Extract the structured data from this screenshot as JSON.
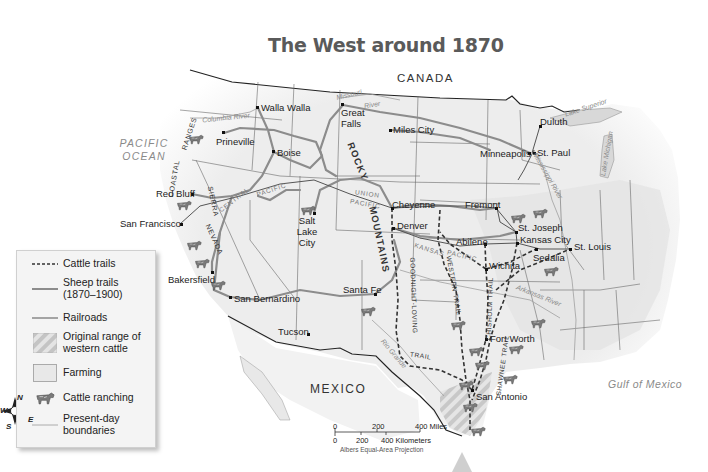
{
  "title": "The West around 1870",
  "regions": {
    "canada": "CANADA",
    "mexico": "MEXICO",
    "pacific_ocean_1": "PACIFIC",
    "pacific_ocean_2": "OCEAN",
    "gulf": "Gulf of Mexico"
  },
  "cities": [
    {
      "name": "Walla Walla",
      "x": 258,
      "y": 108
    },
    {
      "name": "Prineville",
      "x": 224,
      "y": 133
    },
    {
      "name": "Boise",
      "x": 274,
      "y": 152
    },
    {
      "name": "Great Falls",
      "x": 343,
      "y": 105
    },
    {
      "name": "Miles City",
      "x": 390,
      "y": 130
    },
    {
      "name": "Duluth",
      "x": 540,
      "y": 126
    },
    {
      "name": "Minneapolis",
      "x": 530,
      "y": 153
    },
    {
      "name": "St. Paul",
      "x": 532,
      "y": 153
    },
    {
      "name": "Red Bluff",
      "x": 192,
      "y": 194
    },
    {
      "name": "San Francisco",
      "x": 180,
      "y": 224
    },
    {
      "name": "Salt Lake City",
      "x": 314,
      "y": 213
    },
    {
      "name": "Cheyenne",
      "x": 392,
      "y": 208
    },
    {
      "name": "Denver",
      "x": 393,
      "y": 228
    },
    {
      "name": "Fremont",
      "x": 496,
      "y": 208
    },
    {
      "name": "St. Joseph",
      "x": 516,
      "y": 232
    },
    {
      "name": "Kansas City",
      "x": 517,
      "y": 243
    },
    {
      "name": "Abilene",
      "x": 485,
      "y": 244
    },
    {
      "name": "Sedalia",
      "x": 536,
      "y": 249
    },
    {
      "name": "St. Louis",
      "x": 570,
      "y": 249
    },
    {
      "name": "Wichita",
      "x": 486,
      "y": 269
    },
    {
      "name": "Bakersfield",
      "x": 212,
      "y": 272
    },
    {
      "name": "San Bernardino",
      "x": 230,
      "y": 297
    },
    {
      "name": "Santa Fe",
      "x": 375,
      "y": 294
    },
    {
      "name": "Tucson",
      "x": 308,
      "y": 334
    },
    {
      "name": "Fort Worth",
      "x": 486,
      "y": 339
    },
    {
      "name": "San Antonio",
      "x": 472,
      "y": 390
    }
  ],
  "rivers": {
    "columbia": "Columbia River",
    "missouri": "Missouri",
    "river": "River",
    "mississippi": "Mississippi River",
    "arkansas": "Arkansas River",
    "rio_grande": "Rio Grande"
  },
  "lakes": {
    "superior": "Lake Superior",
    "michigan": "Lake Michigan"
  },
  "mountains": {
    "rocky": "ROCKY",
    "mountains": "MOUNTAINS",
    "coastal": "COASTAL",
    "ranges": "RANGES",
    "sierra": "SIERRA",
    "nevada": "NEVADA"
  },
  "railroads": {
    "union": "UNION",
    "pacific": "PACIFIC",
    "central": "CENTRAL",
    "pacific2": "PACIFIC",
    "kansas": "KANSAS",
    "pacific3": "PACIFIC"
  },
  "trails": {
    "goodnight_loving": "GOODNIGHT-LOVING",
    "trail": "TRAIL",
    "western": "WESTERN TRAIL",
    "chisholm": "CHISHOLM TRAIL",
    "shawnee": "SHAWNEE TRAIL"
  },
  "legend": {
    "items": [
      {
        "label": "Cattle trails",
        "symbol": "dashed-line"
      },
      {
        "label": "Sheep trails (1870–1900)",
        "symbol": "gray-line"
      },
      {
        "label": "Railroads",
        "symbol": "thin-line"
      },
      {
        "label": "Original range of western cattle",
        "symbol": "hatched-box"
      },
      {
        "label": "Farming",
        "symbol": "light-box"
      },
      {
        "label": "Cattle ranching",
        "symbol": "cow-icon"
      },
      {
        "label": "Present-day boundaries",
        "symbol": "light-line"
      }
    ]
  },
  "compass": {
    "n": "N",
    "s": "S",
    "e": "E",
    "w": "W"
  },
  "scale": {
    "miles": [
      "0",
      "200",
      "400 Miles"
    ],
    "km": [
      "0",
      "200",
      "400 Kilometers"
    ],
    "projection": "Albers Equal-Area Projection"
  },
  "colors": {
    "sheep_trail": "#8c8c8c",
    "railroad": "#555555",
    "boundary": "#6a6a6a",
    "land": "#efefef",
    "cattle_trail": "#333333"
  }
}
